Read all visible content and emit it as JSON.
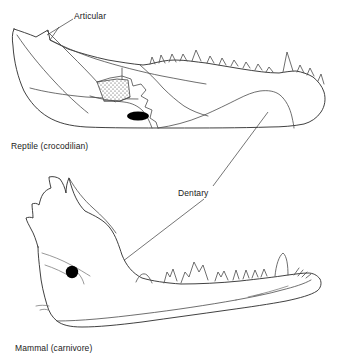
{
  "figure": {
    "background_color": "#ffffff",
    "ink_color": "#2b2b2b",
    "width": 338,
    "height": 364
  },
  "labels": {
    "articular": "Articular",
    "dentary": "Dentary"
  },
  "captions": {
    "reptile": "Reptile (crocodilian)",
    "mammal": "Mammal (carnivore)"
  },
  "panels": [
    {
      "id": "reptile-panel",
      "caption": "Reptile (crocodilian)",
      "organism": "crocodilian",
      "view": "left lateral view of lower jaw",
      "features": [
        "multiple composite bones",
        "stippled articular bone region",
        "external mandibular fenestra (solid black)",
        "row of conical homodont teeth along dorsal margin",
        "enlarged caniniform tooth near anterior third",
        "retroarticular process at posterior end"
      ],
      "annotated_bone": "Articular"
    },
    {
      "id": "mammal-panel",
      "caption": "Mammal (carnivore)",
      "organism": "carnivore",
      "view": "left lateral view of lower jaw",
      "features": [
        "single bone (dentary)",
        "tall coronoid process",
        "mental foramen (solid black)",
        "heterodont dentition: incisors, canine, premolars, carnassial molar",
        "angular process at posterior-ventral margin"
      ],
      "annotated_bone": "Dentary"
    }
  ],
  "annotations": [
    {
      "name": "articular-leader",
      "label": "Articular",
      "points_to": "articular region at posterior of reptile jaw"
    },
    {
      "name": "dentary-leader",
      "label": "Dentary",
      "points_to": "dentary bone in both reptile and mammal jaws"
    }
  ],
  "colors": {
    "ink": "#2b2b2b",
    "secondary_line": "#4a4a4a",
    "faint_line": "#777777",
    "fill": "#ffffff",
    "foramen": "#000000",
    "text": "#1a1a1a"
  }
}
